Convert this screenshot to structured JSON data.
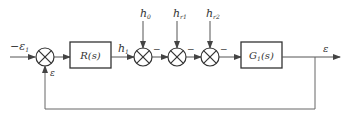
{
  "diagram": {
    "type": "block-diagram",
    "colors": {
      "line": "#555555",
      "block_border": "#333333",
      "background": "#ffffff"
    },
    "input": {
      "label": "−ε",
      "subscript": "1"
    },
    "feedback_label": "ε",
    "blocks": [
      {
        "id": "R",
        "label": "R(s)"
      },
      {
        "id": "G1",
        "label": "G",
        "subscript": "1",
        "suffix": "(s)"
      }
    ],
    "signals": {
      "h1": {
        "label": "h",
        "subscript": "1"
      },
      "output": {
        "label": "ε"
      }
    },
    "disturbances": [
      {
        "label": "h",
        "subscript": "0",
        "sign": "−"
      },
      {
        "label": "h",
        "subscript": "r1",
        "sign": "−"
      },
      {
        "label": "h",
        "subscript": "r2",
        "sign": "−"
      }
    ],
    "summing_junctions": 4
  }
}
